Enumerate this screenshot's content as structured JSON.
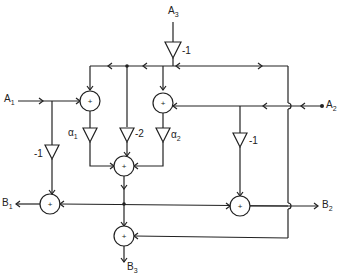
{
  "diagram": {
    "type": "signal-flow network",
    "inputs": [
      {
        "id": "A1",
        "label": "A",
        "sub": "1"
      },
      {
        "id": "A2",
        "label": "A",
        "sub": "2"
      },
      {
        "id": "A3",
        "label": "A",
        "sub": "3"
      }
    ],
    "outputs": [
      {
        "id": "B1",
        "label": "B",
        "sub": "1"
      },
      {
        "id": "B2",
        "label": "B",
        "sub": "2"
      },
      {
        "id": "B3",
        "label": "B",
        "sub": "3"
      }
    ],
    "gains": [
      {
        "id": "g_a3",
        "label": "-1"
      },
      {
        "id": "g_alpha1",
        "label": "α",
        "sub": "1"
      },
      {
        "id": "g_m2",
        "label": "-2"
      },
      {
        "id": "g_alpha2",
        "label": "α",
        "sub": "2"
      },
      {
        "id": "g_a2",
        "label": "-1"
      },
      {
        "id": "g_a1",
        "label": "-1"
      }
    ],
    "summer_symbol": "+"
  }
}
